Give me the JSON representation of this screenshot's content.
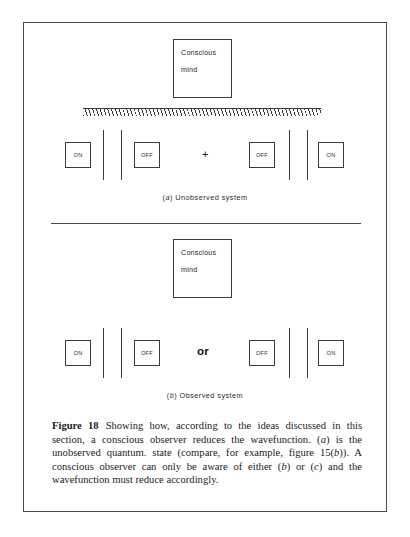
{
  "figure": {
    "number_label": "Figure 18",
    "caption_parts": {
      "p1": "Showing how, according to the ideas discussed in this section, a conscious observer reduces the wavefunction. (",
      "a": "a",
      "p2": ") is the unobserved quantum. state (compare, for example, figure 15(",
      "b1": "b",
      "p3": ")). A conscious observer can only be aware of either (",
      "b2": "b",
      "p4": ") or (",
      "c": "c",
      "p5": ") and the wavefunction must reduce accordingly."
    },
    "caption_full": "Figure 18   Showing how, according to the ideas discussed in this section, a conscious observer reduces the wavefunction. (a) is the unobserved quantum. state (compare, for example, figure 15(b)). A conscious observer can only be aware of either (b) or (c) and the wavefunction must reduce accordingly."
  },
  "panel_a": {
    "id": "a",
    "sub_caption_prefix": "(",
    "sub_caption_letter": "a",
    "sub_caption_suffix": ") Unobserved system",
    "mind_box": {
      "line1": "Conscious",
      "line2": "mind"
    },
    "operator": "+",
    "states": [
      {
        "label": "ON"
      },
      {
        "label": "OFF"
      },
      {
        "label": "OFF"
      },
      {
        "label": "ON"
      }
    ],
    "has_hatched_barrier": true
  },
  "panel_b": {
    "id": "b",
    "sub_caption_prefix": "(",
    "sub_caption_letter": "b",
    "sub_caption_suffix": ") Observed system",
    "mind_box": {
      "line1": "Conscious",
      "line2": "mind"
    },
    "operator": "or",
    "states": [
      {
        "label": "ON"
      },
      {
        "label": "OFF"
      },
      {
        "label": "OFF"
      },
      {
        "label": "ON"
      }
    ],
    "has_hatched_barrier": false
  },
  "colors": {
    "ink": "#1a1a1a",
    "line": "#3c3c3c",
    "frame": "#4a4a4a",
    "page": "#ffffff"
  }
}
